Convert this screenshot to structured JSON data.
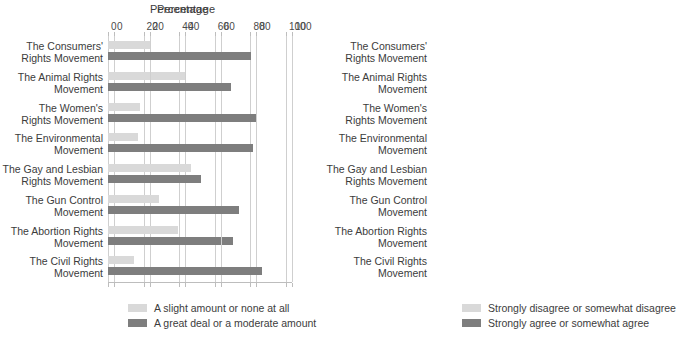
{
  "chart_data": [
    {
      "type": "bar",
      "orientation": "horizontal",
      "panel": "left",
      "title": "Percentage",
      "xlabel": "Percentage",
      "ylabel": "",
      "xlim": [
        0,
        100
      ],
      "xticks": [
        0,
        20,
        40,
        60,
        80,
        100
      ],
      "grid": true,
      "legend_position": "bottom",
      "categories": [
        "The Consumers'\nRights Movement",
        "The Animal Rights\nMovement",
        "The Women's\nRights Movement",
        "The Environmental\nMovement",
        "The Gay and Lesbian\nRights Movement",
        "The Gun Control\nMovement",
        "The Abortion Rights\nMovement",
        "The Civil Rights\nMovement"
      ],
      "series": [
        {
          "name": "A slight amount or none at all",
          "color": "#d9d9d9",
          "values": [
            24,
            43,
            18,
            17,
            35,
            17,
            19,
            11
          ]
        },
        {
          "name": "A great deal or a moderate amount",
          "color": "#7e7e7e",
          "values": [
            62,
            45,
            77,
            71,
            52,
            68,
            70,
            80
          ]
        }
      ]
    },
    {
      "type": "bar",
      "orientation": "horizontal",
      "panel": "right",
      "title": "Percentage",
      "xlabel": "Percentage",
      "ylabel": "",
      "xlim": [
        0,
        100
      ],
      "xticks": [
        0,
        20,
        40,
        60,
        80,
        100
      ],
      "grid": true,
      "legend_position": "bottom",
      "categories": [
        "The Consumers'\nRights Movement",
        "The Animal Rights\nMovement",
        "The Women's\nRights Movement",
        "The Environmental\nMovement",
        "The Gay and Lesbian\nRights Movement",
        "The Gun Control\nMovement",
        "The Abortion Rights\nMovement",
        "The Civil Rights\nMovement"
      ],
      "series": [
        {
          "name": "Strongly disagree or somewhat disagree",
          "color": "#d9d9d9",
          "values": [
            9,
            20,
            10,
            12,
            43,
            25,
            36,
            11
          ]
        },
        {
          "name": "Strongly agree or somewhat agree",
          "color": "#7e7e7e",
          "values": [
            77,
            66,
            80,
            78,
            46,
            70,
            59,
            83
          ]
        }
      ]
    }
  ],
  "colors": {
    "light_series": "#d9d9d9",
    "dark_series": "#7e7e7e",
    "gridline": "#cfcfcf",
    "text": "#3c3c3c",
    "background": "#ffffff"
  }
}
